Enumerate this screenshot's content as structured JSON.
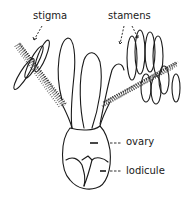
{
  "diagram": {
    "labels": {
      "stigma": "stigma",
      "stamens": "stamens",
      "ovary": "ovary",
      "lodicule": "lodicule"
    },
    "colors": {
      "ink": "#1a1a1a",
      "background": "#ffffff"
    }
  }
}
